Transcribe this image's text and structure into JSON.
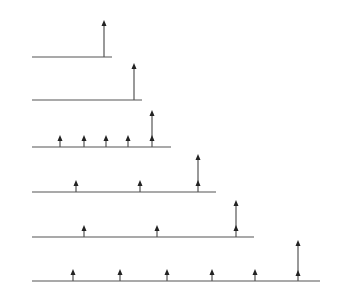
{
  "diagram": {
    "colors": {
      "line": "#555555",
      "arrow": "#222222"
    },
    "rows": [
      {
        "baseline_y": 57,
        "x_start": 32,
        "x_end": 112,
        "small_impulses_x": [],
        "tall_impulse": {
          "x": 104,
          "top_y": 20,
          "mid_head_y": null
        }
      },
      {
        "baseline_y": 100,
        "x_start": 32,
        "x_end": 142,
        "small_impulses_x": [],
        "tall_impulse": {
          "x": 134,
          "top_y": 63,
          "mid_head_y": null
        }
      },
      {
        "baseline_y": 147,
        "x_start": 32,
        "x_end": 171,
        "small_impulses_x": [
          60,
          84,
          106,
          128
        ],
        "tall_impulse": {
          "x": 152,
          "top_y": 110,
          "mid_head_y": 135
        }
      },
      {
        "baseline_y": 192,
        "x_start": 32,
        "x_end": 216,
        "small_impulses_x": [
          76,
          140
        ],
        "tall_impulse": {
          "x": 198,
          "top_y": 154,
          "mid_head_y": 180
        }
      },
      {
        "baseline_y": 237,
        "x_start": 32,
        "x_end": 254,
        "small_impulses_x": [
          84,
          157
        ],
        "tall_impulse": {
          "x": 236,
          "top_y": 200,
          "mid_head_y": 225
        }
      },
      {
        "baseline_y": 281,
        "x_start": 32,
        "x_end": 320,
        "small_impulses_x": [
          73,
          120,
          167,
          212,
          255
        ],
        "tall_impulse": {
          "x": 298,
          "top_y": 240,
          "mid_head_y": 270
        }
      }
    ],
    "small_impulse_height": 12
  }
}
